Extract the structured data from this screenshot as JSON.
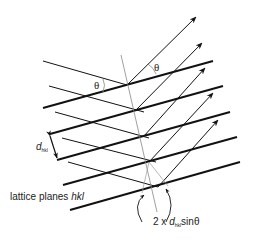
{
  "diagram": {
    "labels": {
      "theta_incident": "θ",
      "theta_reflected": "θ",
      "d_symbol": "d",
      "d_subscript": "hkl",
      "lattice_planes_prefix": "lattice planes ",
      "lattice_planes_hkl": "hkl",
      "path_prefix": "2 x ",
      "path_d": "d",
      "path_subscript": "hkl",
      "path_suffix": "sinθ"
    },
    "colors": {
      "line": "#111111",
      "thin_line": "#888888"
    }
  }
}
